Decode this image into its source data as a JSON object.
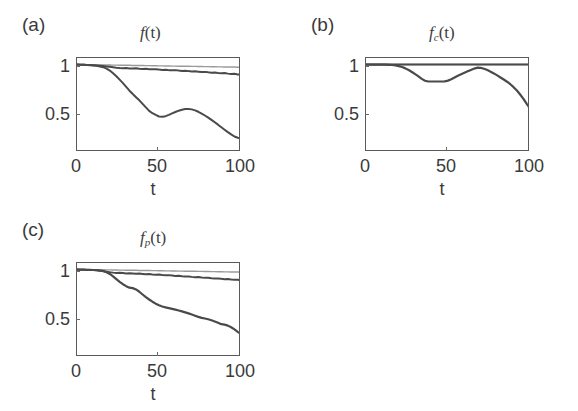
{
  "figure": {
    "background": "#ffffff",
    "axis_color": "#5a5a5a",
    "text_color": "#3a3a3a"
  },
  "panels": [
    {
      "id": "a",
      "label": "(a)",
      "title_base": "f",
      "title_sub": "",
      "title_tail": "(t)"
    },
    {
      "id": "b",
      "label": "(b)",
      "title_base": "f",
      "title_sub": "c",
      "title_tail": "(t)"
    },
    {
      "id": "c",
      "label": "(c)",
      "title_base": "f",
      "title_sub": "p",
      "title_tail": "(t)"
    }
  ],
  "axes": {
    "xlabel": "t",
    "xticks": [
      "0",
      "50",
      "100"
    ],
    "xtick_values": [
      0,
      50,
      100
    ],
    "yticks": [
      "1",
      "0.5"
    ],
    "ytick_values": [
      1,
      0.5
    ],
    "xlim": [
      0,
      100
    ],
    "ylim": [
      0.2,
      1.06
    ]
  },
  "chart_data": [
    {
      "type": "line",
      "panel": "a",
      "title": "f(t)",
      "xlabel": "t",
      "ylabel": "",
      "xlim": [
        0,
        100
      ],
      "ylim": [
        0.2,
        1.06
      ],
      "xticks": [
        0,
        50,
        100
      ],
      "yticks": [
        0.5,
        1
      ],
      "grid": false,
      "legend": "none",
      "x": [
        0,
        2,
        4,
        6,
        8,
        10,
        12,
        14,
        16,
        18,
        20,
        22,
        24,
        26,
        28,
        30,
        32,
        34,
        36,
        38,
        40,
        42,
        44,
        46,
        48,
        50,
        52,
        54,
        56,
        58,
        60,
        62,
        64,
        66,
        68,
        70,
        72,
        74,
        76,
        78,
        80,
        82,
        84,
        86,
        88,
        90,
        92,
        94,
        96,
        98,
        100
      ],
      "series": [
        {
          "name": "flat-upper",
          "color": "#9a9a9a",
          "width": 1.4,
          "values": [
            1.0,
            1.0,
            1.0,
            0.999,
            0.999,
            0.998,
            0.998,
            0.997,
            0.997,
            0.996,
            0.996,
            0.995,
            0.995,
            0.994,
            0.994,
            0.993,
            0.993,
            0.992,
            0.992,
            0.991,
            0.991,
            0.99,
            0.99,
            0.989,
            0.989,
            0.988,
            0.988,
            0.987,
            0.987,
            0.986,
            0.986,
            0.985,
            0.985,
            0.984,
            0.984,
            0.983,
            0.983,
            0.982,
            0.982,
            0.981,
            0.981,
            0.98,
            0.98,
            0.979,
            0.979,
            0.978,
            0.978,
            0.977,
            0.977,
            0.976,
            0.976
          ]
        },
        {
          "name": "slow-decay",
          "color": "#4a4a4a",
          "width": 2.0,
          "values": [
            1.0,
            0.999,
            0.998,
            0.997,
            0.996,
            0.994,
            0.992,
            0.99,
            0.987,
            0.983,
            0.979,
            0.975,
            0.971,
            0.968,
            0.966,
            0.968,
            0.965,
            0.963,
            0.966,
            0.962,
            0.96,
            0.962,
            0.958,
            0.956,
            0.958,
            0.954,
            0.951,
            0.953,
            0.949,
            0.947,
            0.949,
            0.945,
            0.942,
            0.944,
            0.94,
            0.937,
            0.939,
            0.935,
            0.931,
            0.933,
            0.929,
            0.926,
            0.928,
            0.923,
            0.92,
            0.922,
            0.917,
            0.913,
            0.915,
            0.91,
            0.906
          ]
        },
        {
          "name": "fast-decay",
          "color": "#4a4a4a",
          "width": 2.0,
          "values": [
            1.0,
            0.999,
            0.998,
            0.996,
            0.994,
            0.991,
            0.988,
            0.983,
            0.976,
            0.963,
            0.945,
            0.92,
            0.893,
            0.862,
            0.83,
            0.796,
            0.761,
            0.73,
            0.701,
            0.673,
            0.64,
            0.608,
            0.576,
            0.555,
            0.539,
            0.525,
            0.522,
            0.528,
            0.54,
            0.553,
            0.566,
            0.578,
            0.587,
            0.593,
            0.594,
            0.59,
            0.581,
            0.568,
            0.552,
            0.534,
            0.515,
            0.494,
            0.472,
            0.45,
            0.427,
            0.404,
            0.382,
            0.361,
            0.342,
            0.33,
            0.326
          ]
        }
      ]
    },
    {
      "type": "line",
      "panel": "b",
      "title": "f_c(t)",
      "xlabel": "t",
      "ylabel": "",
      "xlim": [
        0,
        100
      ],
      "ylim": [
        0.2,
        1.06
      ],
      "xticks": [
        0,
        50,
        100
      ],
      "yticks": [
        0.5,
        1
      ],
      "grid": false,
      "legend": "none",
      "x": [
        0,
        2,
        4,
        6,
        8,
        10,
        12,
        14,
        16,
        18,
        20,
        22,
        24,
        26,
        28,
        30,
        32,
        34,
        36,
        38,
        40,
        42,
        44,
        46,
        48,
        50,
        52,
        54,
        56,
        58,
        60,
        62,
        64,
        66,
        68,
        70,
        72,
        74,
        76,
        78,
        80,
        82,
        84,
        86,
        88,
        90,
        92,
        94,
        96,
        98,
        100
      ],
      "series": [
        {
          "name": "flat-upper",
          "color": "#9a9a9a",
          "width": 1.4,
          "values": [
            1.0,
            1.0,
            1.0,
            1.0,
            1.0,
            1.0,
            1.0,
            1.0,
            1.0,
            1.0,
            1.0,
            1.0,
            1.0,
            1.0,
            1.0,
            1.0,
            1.0,
            1.0,
            1.0,
            1.0,
            1.0,
            1.0,
            1.0,
            1.0,
            1.0,
            1.0,
            1.0,
            1.0,
            1.0,
            1.0,
            1.0,
            1.0,
            1.0,
            1.0,
            1.0,
            1.0,
            1.0,
            1.0,
            1.0,
            1.0,
            1.0,
            1.0,
            1.0,
            1.0,
            1.0,
            1.0,
            1.0,
            1.0,
            1.0,
            1.0,
            1.0
          ]
        },
        {
          "name": "flat-unity",
          "color": "#4a4a4a",
          "width": 2.0,
          "values": [
            1.0,
            1.0,
            1.0,
            1.0,
            1.0,
            1.0,
            1.0,
            1.0,
            1.0,
            1.0,
            1.0,
            1.0,
            1.0,
            1.0,
            1.0,
            1.0,
            1.0,
            1.0,
            1.0,
            1.0,
            1.0,
            1.0,
            1.0,
            1.0,
            1.0,
            1.0,
            1.0,
            1.0,
            1.0,
            1.0,
            1.0,
            1.0,
            1.0,
            1.0,
            1.0,
            1.0,
            1.0,
            1.0,
            1.0,
            1.0,
            1.0,
            1.0,
            1.0,
            1.0,
            1.0,
            1.0,
            1.0,
            1.0,
            1.0,
            1.0,
            1.0
          ]
        },
        {
          "name": "dip-recover-decay",
          "color": "#4a4a4a",
          "width": 2.2,
          "values": [
            1.0,
            1.0,
            1.0,
            1.0,
            1.0,
            1.0,
            0.999,
            0.998,
            0.996,
            0.992,
            0.986,
            0.977,
            0.965,
            0.95,
            0.932,
            0.912,
            0.891,
            0.869,
            0.852,
            0.845,
            0.845,
            0.845,
            0.845,
            0.845,
            0.846,
            0.853,
            0.866,
            0.882,
            0.898,
            0.912,
            0.925,
            0.938,
            0.951,
            0.963,
            0.972,
            0.97,
            0.962,
            0.95,
            0.935,
            0.919,
            0.901,
            0.882,
            0.863,
            0.843,
            0.82,
            0.793,
            0.762,
            0.726,
            0.686,
            0.64,
            0.6
          ]
        }
      ]
    },
    {
      "type": "line",
      "panel": "c",
      "title": "f_p(t)",
      "xlabel": "t",
      "ylabel": "",
      "xlim": [
        0,
        100
      ],
      "ylim": [
        0.2,
        1.06
      ],
      "xticks": [
        0,
        50,
        100
      ],
      "yticks": [
        0.5,
        1
      ],
      "grid": false,
      "legend": "none",
      "x": [
        0,
        2,
        4,
        6,
        8,
        10,
        12,
        14,
        16,
        18,
        20,
        22,
        24,
        26,
        28,
        30,
        32,
        34,
        36,
        38,
        40,
        42,
        44,
        46,
        48,
        50,
        52,
        54,
        56,
        58,
        60,
        62,
        64,
        66,
        68,
        70,
        72,
        74,
        76,
        78,
        80,
        82,
        84,
        86,
        88,
        90,
        92,
        94,
        96,
        98,
        100
      ],
      "series": [
        {
          "name": "flat-upper",
          "color": "#9a9a9a",
          "width": 1.4,
          "values": [
            1.0,
            1.0,
            1.0,
            1.0,
            0.999,
            0.999,
            0.999,
            0.998,
            0.998,
            0.997,
            0.997,
            0.996,
            0.996,
            0.995,
            0.995,
            0.994,
            0.994,
            0.993,
            0.993,
            0.992,
            0.992,
            0.991,
            0.991,
            0.99,
            0.99,
            0.989,
            0.989,
            0.988,
            0.988,
            0.987,
            0.987,
            0.986,
            0.986,
            0.985,
            0.985,
            0.984,
            0.984,
            0.983,
            0.983,
            0.982,
            0.982,
            0.981,
            0.981,
            0.98,
            0.98,
            0.979,
            0.979,
            0.978,
            0.978,
            0.977,
            0.977
          ]
        },
        {
          "name": "slow-decay",
          "color": "#4a4a4a",
          "width": 2.0,
          "values": [
            1.0,
            0.999,
            0.998,
            0.997,
            0.996,
            0.995,
            0.993,
            0.99,
            0.986,
            0.981,
            0.976,
            0.972,
            0.969,
            0.971,
            0.968,
            0.965,
            0.967,
            0.964,
            0.961,
            0.963,
            0.96,
            0.957,
            0.959,
            0.955,
            0.952,
            0.954,
            0.95,
            0.947,
            0.949,
            0.945,
            0.941,
            0.943,
            0.939,
            0.936,
            0.937,
            0.933,
            0.93,
            0.931,
            0.927,
            0.924,
            0.925,
            0.921,
            0.918,
            0.919,
            0.915,
            0.912,
            0.913,
            0.909,
            0.906,
            0.907,
            0.903
          ]
        },
        {
          "name": "fast-decay",
          "color": "#4a4a4a",
          "width": 2.2,
          "values": [
            1.0,
            0.999,
            0.999,
            0.998,
            0.997,
            0.996,
            0.994,
            0.991,
            0.986,
            0.976,
            0.96,
            0.938,
            0.913,
            0.888,
            0.866,
            0.848,
            0.834,
            0.83,
            0.818,
            0.797,
            0.772,
            0.748,
            0.726,
            0.706,
            0.688,
            0.673,
            0.662,
            0.654,
            0.647,
            0.64,
            0.633,
            0.625,
            0.617,
            0.608,
            0.599,
            0.589,
            0.578,
            0.567,
            0.558,
            0.552,
            0.545,
            0.536,
            0.525,
            0.513,
            0.5,
            0.496,
            0.487,
            0.472,
            0.452,
            0.43,
            0.41
          ]
        }
      ]
    }
  ]
}
